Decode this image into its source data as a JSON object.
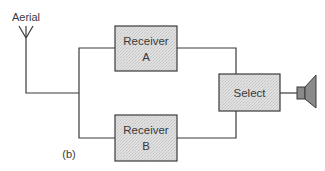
{
  "diagram": {
    "caption": "(b)",
    "aerial": {
      "label": "Aerial"
    },
    "blocks": [
      {
        "id": "receiver_a",
        "line1": "Receiver",
        "line2": "A"
      },
      {
        "id": "receiver_b",
        "line1": "Receiver",
        "line2": "B"
      },
      {
        "id": "select",
        "line1": "Select"
      }
    ],
    "output": {
      "icon": "loudspeaker-icon"
    },
    "connections": [
      [
        "aerial",
        "receiver_a"
      ],
      [
        "aerial",
        "receiver_b"
      ],
      [
        "receiver_a",
        "select"
      ],
      [
        "receiver_b",
        "select"
      ],
      [
        "select",
        "loudspeaker"
      ]
    ],
    "colors": {
      "line": "#3a3a3a",
      "box_fill": "#dcdcdc",
      "speaker_fill": "#8a8a8a",
      "text": "#3a3a3a"
    }
  }
}
